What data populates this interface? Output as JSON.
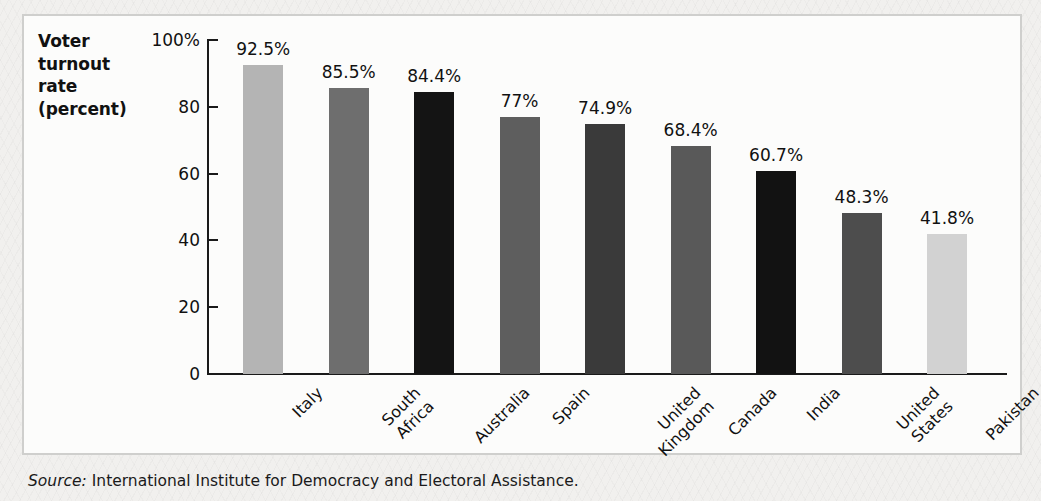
{
  "chart_data": {
    "type": "bar",
    "title": "Voter turnout rate (percent)",
    "title_lines": [
      "Voter",
      "turnout",
      "rate",
      "(percent)"
    ],
    "xlabel": "",
    "ylabel": "Voter turnout rate (percent)",
    "ylim": [
      0,
      100
    ],
    "grid": false,
    "legend": "none",
    "ytick_labels": [
      "100%",
      "80",
      "60",
      "40",
      "20",
      "0"
    ],
    "ytick_values": [
      100,
      80,
      60,
      40,
      20,
      0
    ],
    "categories": [
      "Italy",
      "South Africa",
      "Australia",
      "Spain",
      "United Kingdom",
      "Canada",
      "India",
      "United States",
      "Pakistan"
    ],
    "category_label_lines": [
      [
        "Italy"
      ],
      [
        "South",
        "Africa"
      ],
      [
        "Australia"
      ],
      [
        "Spain"
      ],
      [
        "United",
        "Kingdom"
      ],
      [
        "Canada"
      ],
      [
        "India"
      ],
      [
        "United",
        "States"
      ],
      [
        "Pakistan"
      ]
    ],
    "values": [
      92.5,
      85.5,
      84.4,
      77,
      74.9,
      68.4,
      60.7,
      48.3,
      41.8
    ],
    "value_labels": [
      "92.5%",
      "85.5%",
      "84.4%",
      "77%",
      "74.9%",
      "68.4%",
      "60.7%",
      "48.3%",
      "41.8%"
    ],
    "bar_colors": [
      "#b4b4b4",
      "#6e6e6e",
      "#141414",
      "#5e5e5e",
      "#3a3a3a",
      "#595959",
      "#121212",
      "#4d4d4d",
      "#d2d2d2"
    ]
  },
  "source": {
    "label": "Source:",
    "text": " International Institute for Democracy and Electoral Assistance."
  }
}
